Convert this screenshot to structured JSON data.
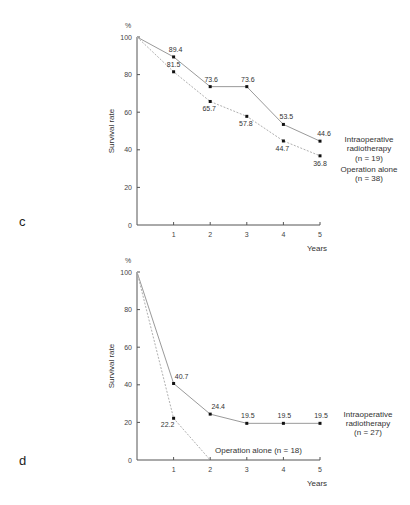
{
  "chart_data": [
    {
      "panel": "c",
      "type": "line",
      "title": "",
      "xlabel": "Years",
      "ylabel": "Survival rate",
      "yunit": "%",
      "x": [
        0,
        1,
        2,
        3,
        4,
        5
      ],
      "xticks": [
        "1",
        "2",
        "3",
        "4",
        "5"
      ],
      "yticks": [
        "0",
        "20",
        "40",
        "60",
        "80",
        "100"
      ],
      "ylim": [
        0,
        100
      ],
      "xlim": [
        0,
        5
      ],
      "grid": false,
      "series": [
        {
          "name": "Intraoperative radiotherapy",
          "n_label": "(n = 19)",
          "style": "solid",
          "values": [
            100,
            89.4,
            73.6,
            73.6,
            53.5,
            44.6
          ],
          "labels": [
            "",
            "89.4",
            "73.6",
            "73.6",
            "53.5",
            "44.6"
          ]
        },
        {
          "name": "Operation alone",
          "n_label": "(n = 38)",
          "style": "dashed",
          "values": [
            100,
            81.5,
            65.7,
            57.8,
            44.7,
            36.8
          ],
          "labels": [
            "",
            "81.5",
            "65.7",
            "57.8",
            "44.7",
            "36.8"
          ]
        }
      ]
    },
    {
      "panel": "d",
      "type": "line",
      "title": "",
      "xlabel": "Years",
      "ylabel": "Survival rate",
      "yunit": "%",
      "x": [
        0,
        1,
        2,
        3,
        4,
        5
      ],
      "xticks": [
        "1",
        "2",
        "3",
        "4",
        "5"
      ],
      "yticks": [
        "0",
        "20",
        "40",
        "60",
        "80",
        "100"
      ],
      "ylim": [
        0,
        100
      ],
      "xlim": [
        0,
        5
      ],
      "grid": false,
      "series": [
        {
          "name": "Intraoperative radiotherapy",
          "n_label": "(n = 27)",
          "style": "solid",
          "values": [
            100,
            40.7,
            24.4,
            19.5,
            19.5,
            19.5
          ],
          "labels": [
            "",
            "40.7",
            "24.4",
            "19.5",
            "19.5",
            "19.5"
          ]
        },
        {
          "name": "Operation alone",
          "n_label": "(n = 18)",
          "style": "dashed",
          "values": [
            100,
            22.2,
            0
          ],
          "labels": [
            "",
            "22.2",
            ""
          ]
        }
      ]
    }
  ],
  "panels": {
    "c": {
      "label": "c",
      "yunit": "%",
      "ylabel": "Survival rate",
      "xlabel": "Years",
      "yticks": [
        "0",
        "20",
        "40",
        "60",
        "80",
        "100"
      ],
      "xticks": [
        "1",
        "2",
        "3",
        "4",
        "5"
      ],
      "legend_solid_1": "Intraoperative",
      "legend_solid_2": "radiotherapy",
      "legend_solid_3": "(n = 19)",
      "legend_dashed_1": "Operation alone",
      "legend_dashed_2": "(n = 38)",
      "labels_solid": [
        "89.4",
        "73.6",
        "73.6",
        "53.5",
        "44.6"
      ],
      "labels_dashed": [
        "81.5",
        "65.7",
        "57.8",
        "44.7",
        "36.8"
      ]
    },
    "d": {
      "label": "d",
      "yunit": "%",
      "ylabel": "Survival rate",
      "xlabel": "Years",
      "yticks": [
        "0",
        "20",
        "40",
        "60",
        "80",
        "100"
      ],
      "xticks": [
        "1",
        "2",
        "3",
        "4",
        "5"
      ],
      "legend_solid_1": "Intraoperative",
      "legend_solid_2": "radiotherapy",
      "legend_solid_3": "(n = 27)",
      "legend_dashed": "Operation alone (n = 18)",
      "labels_solid": [
        "40.7",
        "24.4",
        "19.5",
        "19.5",
        "19.5"
      ],
      "labels_dashed": [
        "22.2"
      ]
    }
  }
}
